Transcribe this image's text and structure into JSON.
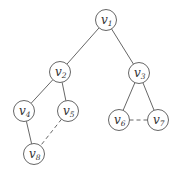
{
  "diagram": {
    "type": "graph",
    "node_radius": 10.5,
    "colors": {
      "stroke": "#555555",
      "fill": "#ffffff",
      "text": "#333333"
    },
    "nodes": [
      {
        "id": "v1",
        "base": "v",
        "sub": "1",
        "x": 106,
        "y": 20
      },
      {
        "id": "v2",
        "base": "v",
        "sub": "2",
        "x": 60,
        "y": 72
      },
      {
        "id": "v3",
        "base": "v",
        "sub": "3",
        "x": 139,
        "y": 73
      },
      {
        "id": "v4",
        "base": "v",
        "sub": "4",
        "x": 24,
        "y": 111
      },
      {
        "id": "v5",
        "base": "v",
        "sub": "5",
        "x": 68,
        "y": 111
      },
      {
        "id": "v6",
        "base": "v",
        "sub": "6",
        "x": 119,
        "y": 120
      },
      {
        "id": "v7",
        "base": "v",
        "sub": "7",
        "x": 158,
        "y": 120
      },
      {
        "id": "v8",
        "base": "v",
        "sub": "8",
        "x": 34,
        "y": 154
      }
    ],
    "edges": [
      {
        "from": "v1",
        "to": "v2",
        "style": "solid"
      },
      {
        "from": "v1",
        "to": "v3",
        "style": "solid"
      },
      {
        "from": "v2",
        "to": "v4",
        "style": "solid"
      },
      {
        "from": "v2",
        "to": "v5",
        "style": "solid"
      },
      {
        "from": "v3",
        "to": "v6",
        "style": "solid"
      },
      {
        "from": "v3",
        "to": "v7",
        "style": "solid"
      },
      {
        "from": "v4",
        "to": "v8",
        "style": "solid"
      },
      {
        "from": "v5",
        "to": "v8",
        "style": "dashed"
      },
      {
        "from": "v6",
        "to": "v7",
        "style": "dashed"
      }
    ]
  }
}
